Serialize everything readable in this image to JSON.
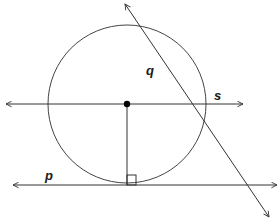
{
  "diagram": {
    "type": "geometry",
    "stroke_color": "#333333",
    "background": "#ffffff",
    "circle": {
      "cx": 127,
      "cy": 104,
      "r": 79
    },
    "center_point": {
      "x": 127,
      "y": 104
    },
    "radius_segment": {
      "x1": 127,
      "y1": 104,
      "x2": 127,
      "y2": 185
    },
    "right_angle_marker": {
      "x": 127,
      "y": 175,
      "size": 9
    },
    "lines": [
      {
        "id": "s",
        "label": "s",
        "x1": 6,
        "y1": 104,
        "x2": 243,
        "y2": 104,
        "label_pos": {
          "x": 214,
          "y": 89
        }
      },
      {
        "id": "p",
        "label": "p",
        "x1": 13,
        "y1": 185,
        "x2": 277,
        "y2": 185,
        "label_pos": {
          "x": 45,
          "y": 169
        }
      },
      {
        "id": "q",
        "label": "q",
        "x1": 125,
        "y1": 4,
        "x2": 269,
        "y2": 217,
        "label_pos": {
          "x": 146,
          "y": 64
        }
      }
    ]
  }
}
